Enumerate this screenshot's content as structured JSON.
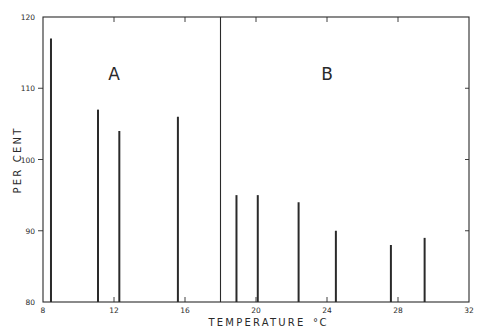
{
  "chart_data": {
    "type": "bar",
    "title": "",
    "xlabel": "TEMPERATURE °C",
    "ylabel": "PER CENT",
    "xlim": [
      8,
      32
    ],
    "ylim": [
      80,
      120
    ],
    "x_ticks": [
      8,
      12,
      16,
      20,
      24,
      28,
      32
    ],
    "y_ticks": [
      80,
      90,
      100,
      110,
      120
    ],
    "grid": false,
    "legend": null,
    "divider_x": 18,
    "panels": [
      {
        "label": "A",
        "x": [
          8.45,
          11.1,
          12.3,
          15.6
        ],
        "values": [
          117,
          107,
          104,
          106
        ]
      },
      {
        "label": "B",
        "x": [
          18.9,
          20.1,
          22.4,
          24.5,
          27.6,
          29.5
        ],
        "values": [
          95,
          95,
          94,
          90,
          88,
          89
        ]
      }
    ],
    "annotations": [
      "A",
      "B"
    ]
  },
  "axis": {
    "xlabel_text": "TEMPERATURE",
    "xlabel_unit": "°C",
    "ylabel_text": "PER CENT"
  },
  "panel_labels": {
    "a": "A",
    "b": "B"
  },
  "colors": {
    "ink": "#2a2a2a",
    "background": "#ffffff"
  }
}
